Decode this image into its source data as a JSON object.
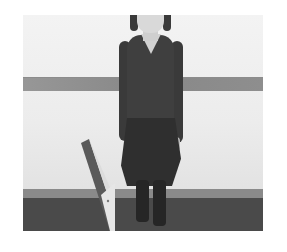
{
  "image": {
    "description": "Grayscale photograph of a person in a dark long-sleeve top and dark skirt standing against a white wall with a horizontal gray stripe, dark floor, and a tilted angled board at lower left",
    "colors": {
      "background": "#ffffff",
      "wall": "#ececec",
      "stripe": "#8c8c8c",
      "floor": "#4a4a4a",
      "clothing": "#3a3a3a",
      "board_light": "#dcdcdc",
      "board_dark": "#555555"
    }
  }
}
